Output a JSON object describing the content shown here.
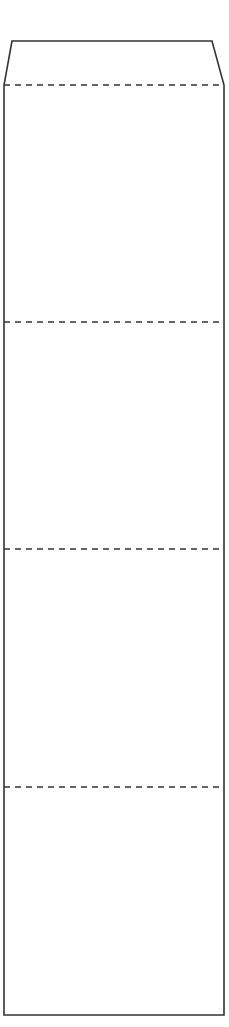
{
  "diagram": {
    "type": "tabbed-column-outline",
    "stroke_color": "#333333",
    "background": "#ffffff",
    "tab": {
      "top_y": 41,
      "top_left_x": 12,
      "top_right_x": 212,
      "base_y": 85,
      "base_left_x": 4,
      "base_right_x": 224
    },
    "body": {
      "left_x": 4,
      "right_x": 224,
      "bottom_y": 1015
    },
    "dashed_dividers": [
      {
        "y": 85
      },
      {
        "y": 322
      },
      {
        "y": 549
      },
      {
        "y": 787
      }
    ],
    "sections": [
      {
        "id": "section-1",
        "top": 85,
        "bottom": 322
      },
      {
        "id": "section-2",
        "top": 322,
        "bottom": 549
      },
      {
        "id": "section-3",
        "top": 549,
        "bottom": 787
      },
      {
        "id": "section-4",
        "top": 787,
        "bottom": 1015
      }
    ]
  }
}
